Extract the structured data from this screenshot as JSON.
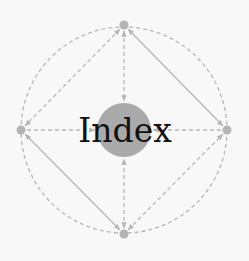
{
  "diagram": {
    "title": "Index",
    "colors": {
      "background": "#f8f8f8",
      "center_fill": "#aaaaaa",
      "node_fill": "#b4b4b4",
      "edge_stroke": "#b6b6b6",
      "text": "#111111"
    },
    "center": {
      "id": "index",
      "label": "Index",
      "x": 124,
      "y": 130,
      "r": 27
    },
    "outer_ring": {
      "x": 124,
      "y": 130,
      "r": 103,
      "style": "dashed"
    },
    "nodes": [
      {
        "id": "top",
        "x": 124,
        "y": 25
      },
      {
        "id": "right",
        "x": 227,
        "y": 130
      },
      {
        "id": "bottom",
        "x": 124,
        "y": 234
      },
      {
        "id": "left",
        "x": 21,
        "y": 130
      }
    ],
    "edges": [
      {
        "from": "top",
        "to": "index",
        "style": "dashed",
        "bidirectional": true
      },
      {
        "from": "bottom",
        "to": "index",
        "style": "dashed",
        "bidirectional": true
      },
      {
        "from": "left",
        "to": "index",
        "style": "dashed",
        "bidirectional": false
      },
      {
        "from": "right",
        "to": "index",
        "style": "dashed",
        "bidirectional": false
      },
      {
        "from": "top",
        "to": "right",
        "style": "solid",
        "bidirectional": true
      },
      {
        "from": "top",
        "to": "left",
        "style": "dashed",
        "bidirectional": true
      },
      {
        "from": "left",
        "to": "bottom",
        "style": "solid",
        "bidirectional": true
      },
      {
        "from": "bottom",
        "to": "right",
        "style": "dashed",
        "bidirectional": true
      }
    ]
  }
}
